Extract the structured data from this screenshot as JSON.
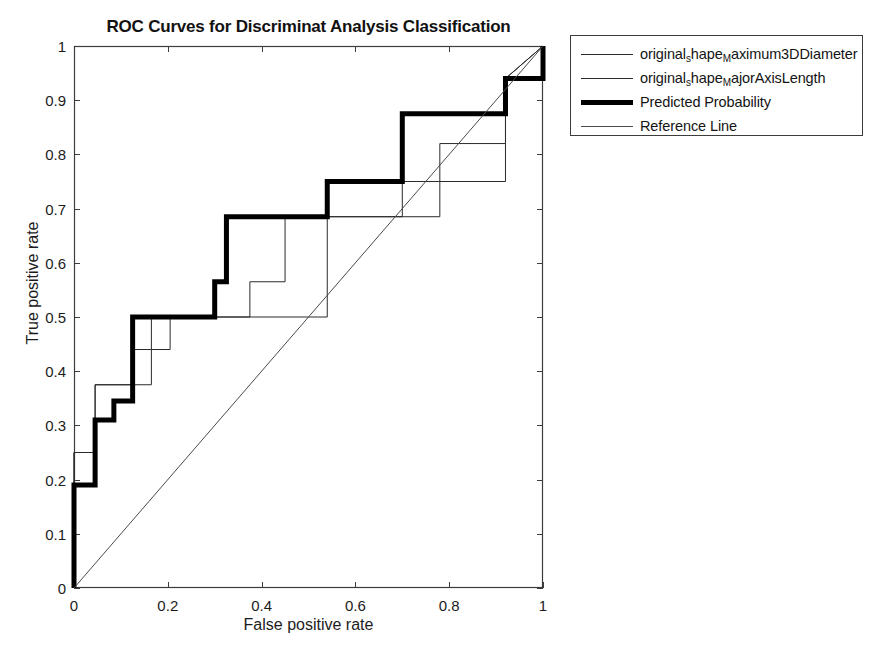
{
  "figure": {
    "width": 885,
    "height": 651,
    "background": "#ffffff"
  },
  "chart_data": {
    "type": "line",
    "title": "ROC Curves for Discriminat Analysis Classification",
    "xlabel": "False positive rate",
    "ylabel": "True positive rate",
    "xlim": [
      0,
      1
    ],
    "ylim": [
      0,
      1
    ],
    "grid": false,
    "legend_position": "outside-top-right",
    "xticks": [
      0,
      0.2,
      0.4,
      0.6,
      0.8,
      1
    ],
    "xtick_labels": [
      "0",
      "0.2",
      "0.4",
      "0.6",
      "0.8",
      "1"
    ],
    "yticks": [
      0,
      0.1,
      0.2,
      0.3,
      0.4,
      0.5,
      0.6,
      0.7,
      0.8,
      0.9,
      1
    ],
    "ytick_labels": [
      "0",
      "0.1",
      "0.2",
      "0.3",
      "0.4",
      "0.5",
      "0.6",
      "0.7",
      "0.8",
      "0.9",
      "1"
    ],
    "series": [
      {
        "name": "original_shape_Maximum3DDiameter",
        "label_main": "original",
        "label_sub1": "s",
        "label_mid": "hape",
        "label_sub2": "M",
        "label_tail": "aximum3DDiameter",
        "style": "thin",
        "color": "#2b2b2b",
        "linewidth": 1,
        "x": [
          0,
          0,
          0.045,
          0.045,
          0.085,
          0.085,
          0.125,
          0.125,
          0.165,
          0.165,
          0.205,
          0.205,
          0.3,
          0.3,
          0.375,
          0.375,
          0.45,
          0.45,
          0.54,
          0.54,
          0.78,
          0.78,
          0.92,
          0.92,
          1
        ],
        "y": [
          0,
          0.25,
          0.25,
          0.375,
          0.375,
          0.375,
          0.375,
          0.44,
          0.44,
          0.5,
          0.5,
          0.5,
          0.5,
          0.5,
          0.5,
          0.565,
          0.565,
          0.685,
          0.685,
          0.685,
          0.685,
          0.82,
          0.82,
          0.94,
          1
        ]
      },
      {
        "name": "original_shape_MajorAxisLength",
        "label_main": "original",
        "label_sub1": "s",
        "label_mid": "hape",
        "label_sub2": "M",
        "label_tail": "ajorAxisLength",
        "style": "thin",
        "color": "#2b2b2b",
        "linewidth": 1,
        "x": [
          0,
          0,
          0.045,
          0.045,
          0.125,
          0.125,
          0.165,
          0.165,
          0.205,
          0.205,
          0.3,
          0.3,
          0.375,
          0.375,
          0.45,
          0.45,
          0.54,
          0.54,
          0.7,
          0.7,
          0.78,
          0.78,
          0.92,
          0.92,
          1
        ],
        "y": [
          0,
          0.25,
          0.25,
          0.375,
          0.375,
          0.375,
          0.375,
          0.44,
          0.44,
          0.5,
          0.5,
          0.5,
          0.5,
          0.5,
          0.5,
          0.5,
          0.5,
          0.685,
          0.685,
          0.75,
          0.75,
          0.75,
          0.75,
          0.94,
          1
        ]
      },
      {
        "name": "Predicted Probability",
        "label_main": "Predicted Probability",
        "style": "thick",
        "color": "#000000",
        "linewidth": 5,
        "x": [
          0,
          0,
          0.045,
          0.045,
          0.085,
          0.085,
          0.125,
          0.125,
          0.3,
          0.3,
          0.325,
          0.325,
          0.54,
          0.54,
          0.7,
          0.7,
          0.92,
          0.92,
          1,
          1
        ],
        "y": [
          0,
          0.19,
          0.19,
          0.31,
          0.31,
          0.345,
          0.345,
          0.5,
          0.5,
          0.565,
          0.565,
          0.685,
          0.685,
          0.75,
          0.75,
          0.875,
          0.875,
          0.94,
          0.94,
          1
        ]
      },
      {
        "name": "Reference Line",
        "label_main": "Reference Line",
        "style": "thin",
        "color": "#4a4a4a",
        "linewidth": 1,
        "x": [
          0,
          1
        ],
        "y": [
          0,
          1
        ]
      }
    ]
  },
  "legend": {
    "entries": [
      {
        "sample": "thin-line-sample",
        "style": "thin"
      },
      {
        "sample": "thin-line-sample",
        "style": "thin"
      },
      {
        "sample": "thick-line-sample",
        "style": "thick"
      },
      {
        "sample": "thin-line-sample",
        "style": "thin"
      }
    ]
  },
  "axes": {
    "frame_color": "#3c3c3c",
    "tick_color": "#3c3c3c"
  }
}
